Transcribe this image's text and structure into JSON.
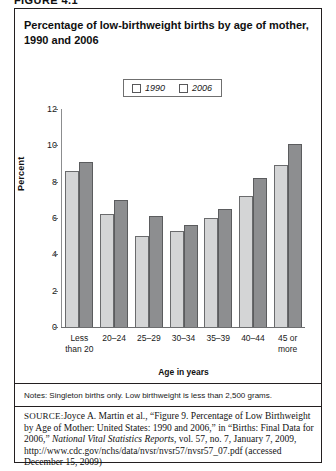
{
  "figure_label": "FIGURE 4.1",
  "title": "Percentage of low-birthweight births by age of mother, 1990 and 2006",
  "legend": {
    "items": [
      {
        "label": "1990",
        "color": "#d4d5d6"
      },
      {
        "label": "2006",
        "color": "#8d8e90"
      }
    ]
  },
  "notes": "Notes: Singleton births only. Low birthweight is less than 2,500 grams.",
  "source": {
    "label": "SOURCE:",
    "text_1": "Joyce A. Martin et al., “Figure 9. Percentage of Low Birthweight by Age of Mother: United States: 1990 and 2006,” in “Births: Final Data for 2006,” ",
    "italic_1": "National Vital Statistics Reports",
    "text_2": ", vol. 57, no. 7, January 7, 2009, http://www.cdc.gov/nchs/data/nvsr/nvsr57/nvsr57_07.pdf (accessed December 15, 2009)"
  },
  "chart_data": {
    "type": "bar",
    "title": "Percentage of low-birthweight births by age of mother, 1990 and 2006",
    "xlabel": "Age in years",
    "ylabel": "Percent",
    "ylim": [
      0,
      12
    ],
    "yticks": [
      0,
      2,
      4,
      6,
      8,
      10,
      12
    ],
    "ytick_labels": [
      "0",
      "2",
      "4",
      "6",
      "8",
      "10",
      "12"
    ],
    "grid": false,
    "legend_position": "top-center",
    "categories": [
      "Less\nthan 20",
      "20–24",
      "25–29",
      "30–34",
      "35–39",
      "40–44",
      "45 or\nmore"
    ],
    "category_lines": [
      [
        "Less",
        "than 20"
      ],
      [
        "20–24"
      ],
      [
        "25–29"
      ],
      [
        "30–34"
      ],
      [
        "35–39"
      ],
      [
        "40–44"
      ],
      [
        "45 or",
        "more"
      ]
    ],
    "series": [
      {
        "name": "1990",
        "color": "#d4d5d6",
        "values": [
          8.6,
          6.2,
          5.0,
          5.3,
          6.0,
          7.2,
          8.9
        ]
      },
      {
        "name": "2006",
        "color": "#8d8e90",
        "values": [
          9.1,
          7.0,
          6.1,
          5.6,
          6.5,
          8.2,
          10.1
        ]
      }
    ]
  }
}
